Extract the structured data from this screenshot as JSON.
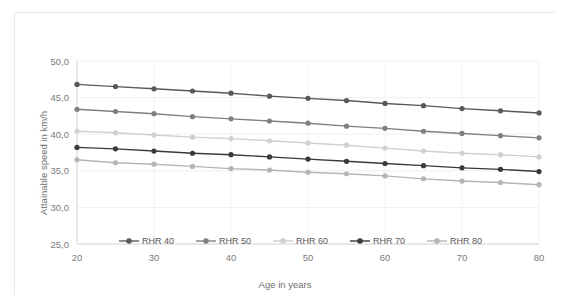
{
  "chart_data": {
    "type": "line",
    "title": "Speed as a Function of RHR and Age at a Flat Course (Men)",
    "xlabel": "Age in years",
    "ylabel": "Attainable speed in km/h",
    "x": [
      20,
      25,
      30,
      35,
      40,
      45,
      50,
      55,
      60,
      65,
      70,
      75,
      80
    ],
    "xlim": [
      20,
      80
    ],
    "ylim": [
      25.0,
      50.0
    ],
    "xticks": [
      20,
      30,
      40,
      50,
      60,
      70,
      80
    ],
    "xtick_labels": [
      "20",
      "30",
      "40",
      "50",
      "60",
      "70",
      "80"
    ],
    "yticks": [
      25.0,
      30.0,
      35.0,
      40.0,
      45.0,
      50.0
    ],
    "ytick_labels": [
      "25,0",
      "30,0",
      "35,0",
      "40,0",
      "45,0",
      "50,0"
    ],
    "grid": "horizontal-and-vertical",
    "legend_position": "inside-bottom-center",
    "series": [
      {
        "name": "RHR 40",
        "color": "#595959",
        "values": [
          46.8,
          46.5,
          46.2,
          45.9,
          45.6,
          45.2,
          44.9,
          44.6,
          44.2,
          43.9,
          43.5,
          43.2,
          42.9
        ]
      },
      {
        "name": "RHR 50",
        "color": "#808080",
        "values": [
          43.4,
          43.1,
          42.8,
          42.4,
          42.1,
          41.8,
          41.5,
          41.1,
          40.8,
          40.4,
          40.1,
          39.8,
          39.5
        ]
      },
      {
        "name": "RHR 60",
        "color": "#d0d0d0",
        "values": [
          40.4,
          40.2,
          39.9,
          39.6,
          39.4,
          39.1,
          38.8,
          38.5,
          38.1,
          37.7,
          37.4,
          37.2,
          36.9
        ]
      },
      {
        "name": "RHR 70",
        "color": "#3a3a3a",
        "values": [
          38.2,
          38.0,
          37.7,
          37.4,
          37.2,
          36.9,
          36.6,
          36.3,
          36.0,
          35.7,
          35.4,
          35.2,
          34.9
        ]
      },
      {
        "name": "RHR 80",
        "color": "#b5b5b5",
        "values": [
          36.5,
          36.1,
          35.9,
          35.6,
          35.3,
          35.1,
          34.8,
          34.6,
          34.3,
          33.9,
          33.6,
          33.4,
          33.1
        ]
      }
    ]
  },
  "legend": {
    "items": [
      {
        "label": "RHR 40"
      },
      {
        "label": "RHR 50"
      },
      {
        "label": "RHR 60"
      },
      {
        "label": "RHR 70"
      },
      {
        "label": "RHR 80"
      }
    ]
  }
}
